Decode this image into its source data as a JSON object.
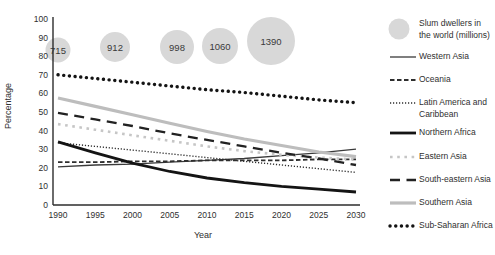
{
  "chart_data": {
    "type": "line",
    "title": "",
    "xlabel": "Year",
    "ylabel": "Percentage",
    "x": [
      1990,
      1995,
      2000,
      2005,
      2010,
      2015,
      2020,
      2025,
      2030
    ],
    "x_ticks": [
      1990,
      1995,
      2000,
      2005,
      2010,
      2015,
      2020,
      2025,
      2030
    ],
    "y_ticks": [
      0,
      10,
      20,
      30,
      40,
      50,
      60,
      70,
      80,
      90,
      100
    ],
    "xlim": [
      1990,
      2030
    ],
    "ylim": [
      0,
      100
    ],
    "grid": false,
    "legend_position": "right",
    "series": [
      {
        "name": "Western Asia",
        "style": "solid-thin-dark",
        "color": "#3a3a3a",
        "values": [
          20.5,
          21.5,
          22,
          23,
          24,
          25,
          26.5,
          28,
          30
        ]
      },
      {
        "name": "Oceania",
        "style": "dashed-dark",
        "color": "#2e2e2e",
        "values": [
          23,
          23,
          23.5,
          23.5,
          24,
          24,
          24,
          24.5,
          24.5
        ]
      },
      {
        "name": "Latin America and Caribbean",
        "style": "fine-dotted-dark",
        "color": "#2e2e2e",
        "values": [
          33.5,
          31.5,
          29.5,
          27.5,
          25.5,
          23.5,
          21.5,
          19.5,
          17.5
        ]
      },
      {
        "name": "Northern Africa",
        "style": "solid-thick-black",
        "color": "#141414",
        "values": [
          34,
          28,
          22.5,
          18,
          14.5,
          12,
          10,
          8.5,
          7
        ]
      },
      {
        "name": "Eastern Asia",
        "style": "dotted-gray",
        "color": "#c6c6c6",
        "values": [
          43.5,
          40.5,
          37.5,
          34.5,
          31.5,
          29,
          27,
          25.5,
          24.5
        ]
      },
      {
        "name": "South-eastern Asia",
        "style": "long-dash-dark",
        "color": "#222222",
        "values": [
          49.5,
          46,
          42.5,
          38.5,
          35,
          31.5,
          28,
          25,
          21.5
        ]
      },
      {
        "name": "Southern Asia",
        "style": "solid-thick-gray",
        "color": "#bdbdbd",
        "values": [
          57.5,
          53,
          48.5,
          44,
          39.5,
          35.5,
          32,
          28.5,
          26
        ]
      },
      {
        "name": "Sub-Saharan Africa",
        "style": "bold-dotted-black",
        "color": "#141414",
        "values": [
          70,
          68,
          66,
          64,
          62,
          60.5,
          58.5,
          56.5,
          55
        ]
      }
    ],
    "bubbles": {
      "label": "Slum dwellers in the world (millions)",
      "color": "#d8d8d8",
      "points": [
        {
          "value": "715",
          "x_px": 58,
          "y_px": 50,
          "r_px": 12.5
        },
        {
          "value": "912",
          "x_px": 115,
          "y_px": 47,
          "r_px": 15
        },
        {
          "value": "998",
          "x_px": 177,
          "y_px": 47,
          "r_px": 17
        },
        {
          "value": "1060",
          "x_px": 220,
          "y_px": 46,
          "r_px": 18
        },
        {
          "value": "1390",
          "x_px": 271,
          "y_px": 41,
          "r_px": 24
        }
      ]
    }
  },
  "legend": {
    "items": [
      {
        "label": "Slum dwellers in\nthe world (millions)",
        "swatch": "bubble-circle",
        "color": "#d8d8d8"
      },
      {
        "label": "Western Asia",
        "swatch": "solid-thin-dark",
        "color": "#3a3a3a"
      },
      {
        "label": "Oceania",
        "swatch": "dashed-dark",
        "color": "#2e2e2e"
      },
      {
        "label": "Latin America and\nCaribbean",
        "swatch": "fine-dotted-dark",
        "color": "#2e2e2e"
      },
      {
        "label": "Northern Africa",
        "swatch": "solid-thick-black",
        "color": "#141414"
      },
      {
        "label": "Eastern Asia",
        "swatch": "dotted-gray",
        "color": "#c6c6c6"
      },
      {
        "label": "South-eastern Asia",
        "swatch": "long-dash-dark",
        "color": "#222222"
      },
      {
        "label": "Southern Asia",
        "swatch": "solid-thick-gray",
        "color": "#bdbdbd"
      },
      {
        "label": "Sub-Saharan Africa",
        "swatch": "bold-dotted-black",
        "color": "#141414"
      }
    ]
  }
}
